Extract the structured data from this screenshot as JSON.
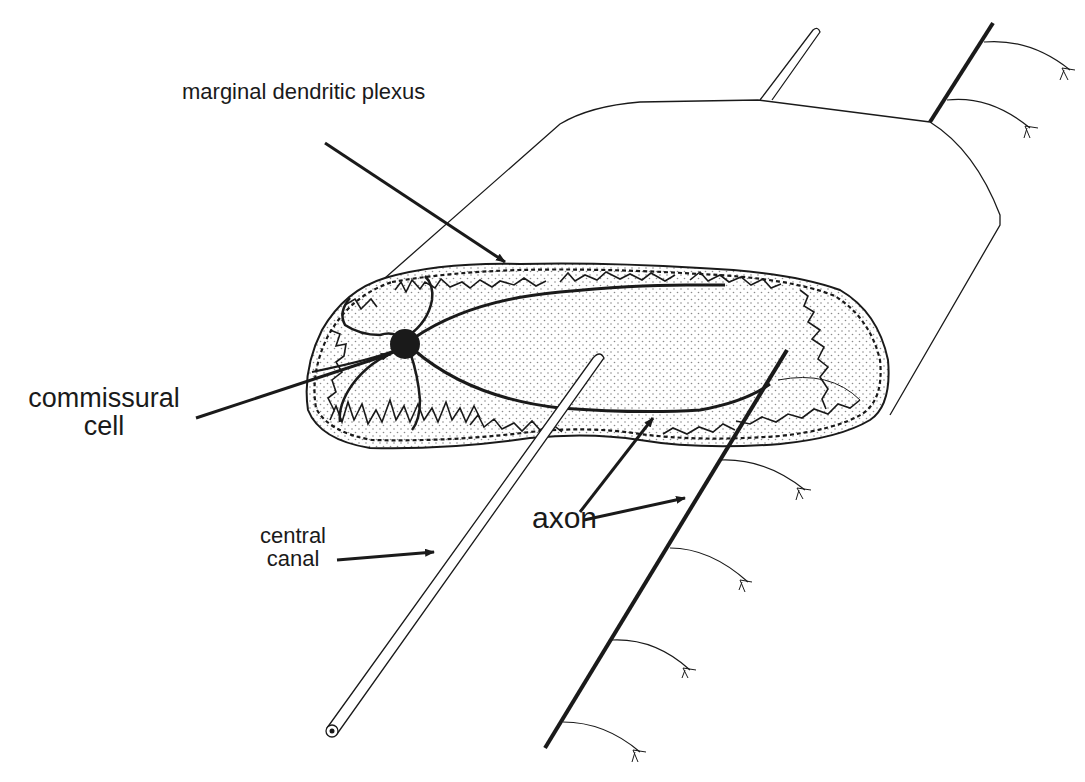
{
  "figure": {
    "type": "anatomical schematic",
    "colors": {
      "ink": "#1a1a1a",
      "stipple": "#8a8a8a",
      "background": "#ffffff"
    },
    "labels": {
      "marginal_dendritic_plexus": "marginal dendritic plexus",
      "commissural_cell_line1": "commissural",
      "commissural_cell_line2": "cell",
      "central_canal_line1": "central",
      "central_canal_line2": "canal",
      "axon": "axon"
    },
    "structures": [
      "spinal cord block outline",
      "stippled gray matter cross-section",
      "marginal dendritic plexus",
      "commissural cell body",
      "dendrites",
      "central canal tube",
      "crossing axon",
      "ascending/descending axon with collaterals"
    ]
  }
}
